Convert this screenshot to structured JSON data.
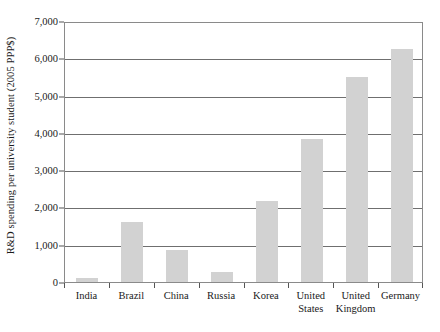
{
  "chart_data": {
    "type": "bar",
    "title": "",
    "subtitle": "",
    "xlabel": "",
    "ylabel": "R&D spending per university student (2005 PPP$)",
    "categories": [
      "India",
      "Brazil",
      "China",
      "Russia",
      "Korea",
      "United States",
      "United Kingdom",
      "Germany"
    ],
    "values": [
      100,
      1600,
      870,
      280,
      2180,
      3840,
      5500,
      6250
    ],
    "ylim": [
      0,
      7000
    ],
    "ytick_values": [
      0,
      1000,
      2000,
      3000,
      4000,
      5000,
      6000,
      7000
    ],
    "ytick_labels": [
      "0",
      "1,000",
      "2,000",
      "3,000",
      "4,000",
      "5,000",
      "6,000",
      "7,000"
    ],
    "grid": true,
    "grid_axis": "y",
    "legend": false,
    "legend_position": "none",
    "bar_color": "#d2d2d2",
    "axis_color": "#8a8a8a",
    "gridline_color": "#6f6f6f",
    "text_color": "#1a1a1a",
    "background_color": "#ffffff"
  },
  "axis": {
    "y_title": "R&D spending per university student (2005 PPP$)"
  },
  "x_labels": [
    {
      "line1": "India",
      "line2": ""
    },
    {
      "line1": "Brazil",
      "line2": ""
    },
    {
      "line1": "China",
      "line2": ""
    },
    {
      "line1": "Russia",
      "line2": ""
    },
    {
      "line1": "Korea",
      "line2": ""
    },
    {
      "line1": "United",
      "line2": "States"
    },
    {
      "line1": "United",
      "line2": "Kingdom"
    },
    {
      "line1": "Germany",
      "line2": ""
    }
  ]
}
